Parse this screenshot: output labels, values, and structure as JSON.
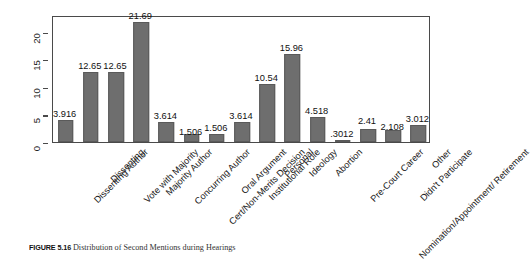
{
  "figure": {
    "caption_number": "FIGURE 5.16",
    "caption_text": "Distribution of Second Mentions during Hearings"
  },
  "chart_data": {
    "type": "bar",
    "title": "",
    "xlabel": "",
    "ylabel": "Percent",
    "ylim": [
      0,
      23
    ],
    "yticks": [
      0,
      5,
      10,
      15,
      20
    ],
    "ytick_labels": [
      "0",
      "5",
      "10",
      "15",
      "20"
    ],
    "grid": false,
    "legend": "none",
    "orientation": "vertical",
    "bar_color": "#6e6e6e",
    "categories": [
      "Dissenting Author",
      "Dissenting",
      "Vote with Majority",
      "Majority Author",
      "Concurring Author",
      "Cert/Non-Merits Decision",
      "Oral Argument",
      "Institutional Role",
      "Personal",
      "Ideology",
      "Abortion",
      "Pre-Court Career",
      "Nomination/Appointment/ Retirement",
      "Didn't Participate",
      "Other"
    ],
    "values": [
      3.916,
      12.65,
      12.65,
      21.69,
      3.614,
      1.506,
      1.506,
      3.614,
      10.54,
      15.96,
      4.518,
      0.3012,
      2.41,
      2.108,
      3.012
    ],
    "value_labels": [
      "3.916",
      "12.65",
      "12.65",
      "21.69",
      "3.614",
      "1.506",
      "1.506",
      "3.614",
      "10.54",
      "15.96",
      "4.518",
      ".3012",
      "2.41",
      "2.108",
      "3.012"
    ]
  }
}
